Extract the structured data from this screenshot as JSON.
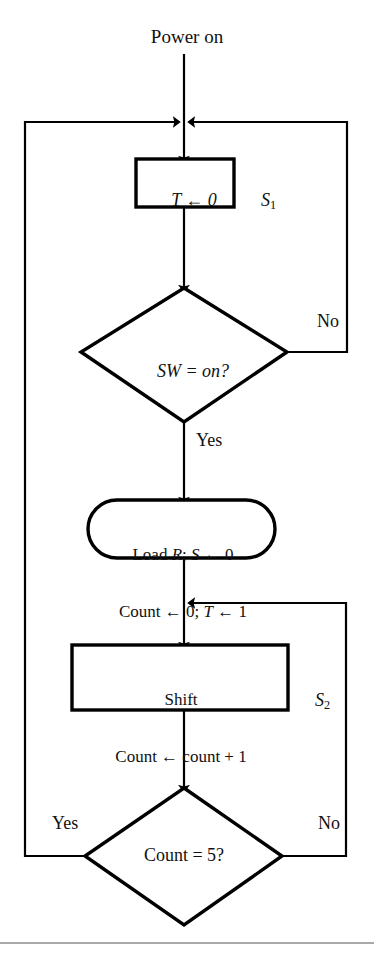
{
  "diagram": {
    "title": "Power on",
    "type": "flowchart",
    "background_color": "#ffffff",
    "line_color": "#000000",
    "nodes": [
      {
        "id": "start",
        "kind": "terminator-label",
        "label": "Power on"
      },
      {
        "id": "s1",
        "kind": "process",
        "label": "T ← 0",
        "state_tag": "S",
        "state_sub": "1"
      },
      {
        "id": "sw",
        "kind": "decision",
        "label": "SW = on?",
        "branch_yes": "Yes",
        "branch_no": "No"
      },
      {
        "id": "load",
        "kind": "rounded-process",
        "line1": "Load R; S ← 0",
        "line2": "Count ← 0; T ← 1"
      },
      {
        "id": "s2",
        "kind": "process",
        "line1": "Shift",
        "line2": "Count ← count + 1",
        "state_tag": "S",
        "state_sub": "2"
      },
      {
        "id": "count5",
        "kind": "decision",
        "label": "Count = 5?",
        "branch_yes": "Yes",
        "branch_no": "No"
      }
    ],
    "edge_labels": {
      "sw_no": "No",
      "sw_yes": "Yes",
      "count_yes": "Yes",
      "count_no": "No"
    },
    "text": {
      "power_on": "Power on",
      "s1_body": "T ← 0",
      "s1_tag_letter": "S",
      "s1_tag_sub": "1",
      "sw_text": "SW = on?",
      "no_top": "No",
      "yes_top": "Yes",
      "load_line1_a": "Load ",
      "load_line1_r": "R",
      "load_line1_b": "; ",
      "load_line1_s": "S",
      "load_line1_c": " ← 0",
      "load_line2_a": "Count ← 0; ",
      "load_line2_t": "T",
      "load_line2_b": " ← 1",
      "shift_line1": "Shift",
      "shift_line2": "Count ← count + 1",
      "s2_tag_letter": "S",
      "s2_tag_sub": "2",
      "count5_text": "Count = 5?",
      "yes_bottom": "Yes",
      "no_bottom": "No"
    }
  }
}
